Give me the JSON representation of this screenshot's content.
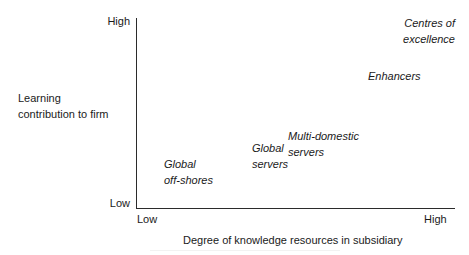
{
  "chart_data": {
    "type": "scatter",
    "title": "",
    "xlabel": "Degree of knowledge resources in subsidiary",
    "ylabel": "Learning contribution to firm",
    "x_ticks": [
      "Low",
      "High"
    ],
    "y_ticks": [
      "High",
      "Low"
    ],
    "grid": false,
    "legend": "none",
    "axes": {
      "x_low": "Low",
      "x_high": "High",
      "y_low": "Low",
      "y_high": "High"
    },
    "items": [
      {
        "label": "Global off-shores",
        "line1": "Global",
        "line2": "off-shores",
        "x_rel": 0.09,
        "y_rel": 0.27
      },
      {
        "label": "Global servers",
        "line1": "Global",
        "line2": "servers",
        "x_rel": 0.36,
        "y_rel": 0.35
      },
      {
        "label": "Multi-domestic servers",
        "line1": "Multi-domestic",
        "line2": "servers",
        "x_rel": 0.48,
        "y_rel": 0.41
      },
      {
        "label": "Enhancers",
        "line1": "Enhancers",
        "line2": "",
        "x_rel": 0.73,
        "y_rel": 0.73
      },
      {
        "label": "Centres of excellence",
        "line1": "Centres of",
        "line2": "excellence",
        "x_rel": 0.95,
        "y_rel": 0.97
      }
    ]
  },
  "ylabel_lines": {
    "line1": "Learning",
    "line2": "contribution to firm"
  }
}
